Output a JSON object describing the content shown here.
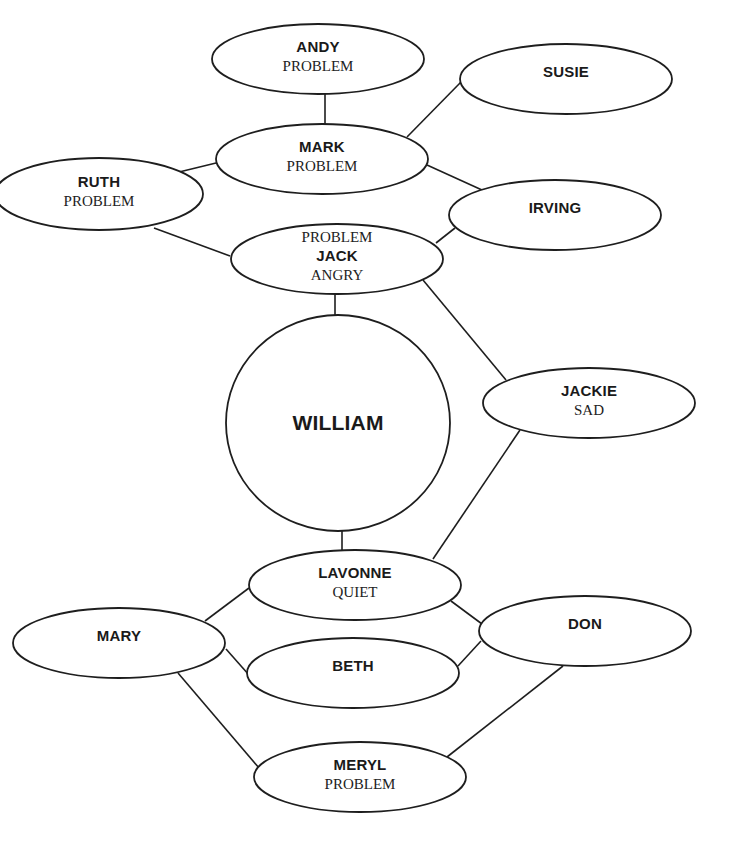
{
  "diagram": {
    "type": "relationship-map",
    "colors": {
      "stroke": "#1e1e1e",
      "fill": "#ffffff",
      "text": "#1a1a1a"
    },
    "nodes": [
      {
        "id": "andy",
        "name": "ANDY",
        "labels_above": [],
        "labels_below": [
          "PROBLEM"
        ],
        "shape": "ellipse",
        "cx": 318,
        "cy": 59,
        "rx": 106,
        "ry": 35
      },
      {
        "id": "susie",
        "name": "SUSIE",
        "labels_above": [],
        "labels_below": [],
        "shape": "ellipse",
        "cx": 566,
        "cy": 79,
        "rx": 106,
        "ry": 35
      },
      {
        "id": "mark",
        "name": "MARK",
        "labels_above": [],
        "labels_below": [
          "PROBLEM"
        ],
        "shape": "ellipse",
        "cx": 322,
        "cy": 159,
        "rx": 106,
        "ry": 35
      },
      {
        "id": "ruth",
        "name": "RUTH",
        "labels_above": [],
        "labels_below": [
          "PROBLEM"
        ],
        "shape": "ellipse",
        "cx": 99,
        "cy": 194,
        "rx": 104,
        "ry": 36
      },
      {
        "id": "irving",
        "name": "IRVING",
        "labels_above": [],
        "labels_below": [],
        "shape": "ellipse",
        "cx": 555,
        "cy": 215,
        "rx": 106,
        "ry": 35
      },
      {
        "id": "jack",
        "name": "JACK",
        "labels_above": [
          "PROBLEM"
        ],
        "labels_below": [
          "ANGRY"
        ],
        "shape": "ellipse",
        "cx": 337,
        "cy": 259,
        "rx": 106,
        "ry": 35
      },
      {
        "id": "william",
        "name": "WILLIAM",
        "labels_above": [],
        "labels_below": [],
        "shape": "circle",
        "cx": 338,
        "cy": 423,
        "rx": 112,
        "ry": 108
      },
      {
        "id": "jackie",
        "name": "JACKIE",
        "labels_above": [],
        "labels_below": [
          "SAD"
        ],
        "shape": "ellipse",
        "cx": 589,
        "cy": 403,
        "rx": 106,
        "ry": 35
      },
      {
        "id": "lavonne",
        "name": "LAVONNE",
        "labels_above": [],
        "labels_below": [
          "QUIET"
        ],
        "shape": "ellipse",
        "cx": 355,
        "cy": 585,
        "rx": 106,
        "ry": 35
      },
      {
        "id": "mary",
        "name": "MARY",
        "labels_above": [],
        "labels_below": [],
        "shape": "ellipse",
        "cx": 119,
        "cy": 643,
        "rx": 106,
        "ry": 35
      },
      {
        "id": "don",
        "name": "DON",
        "labels_above": [],
        "labels_below": [],
        "shape": "ellipse",
        "cx": 585,
        "cy": 631,
        "rx": 106,
        "ry": 35
      },
      {
        "id": "beth",
        "name": "BETH",
        "labels_above": [],
        "labels_below": [],
        "shape": "ellipse",
        "cx": 353,
        "cy": 673,
        "rx": 106,
        "ry": 35
      },
      {
        "id": "meryl",
        "name": "MERYL",
        "labels_above": [],
        "labels_below": [
          "PROBLEM"
        ],
        "shape": "ellipse",
        "cx": 360,
        "cy": 777,
        "rx": 106,
        "ry": 35
      }
    ],
    "edges": [
      {
        "from": "andy",
        "to": "mark",
        "x1": 325,
        "y1": 94,
        "x2": 325,
        "y2": 124
      },
      {
        "from": "mark",
        "to": "susie",
        "x1": 407,
        "y1": 137,
        "x2": 461,
        "y2": 82
      },
      {
        "from": "mark",
        "to": "ruth",
        "x1": 216,
        "y1": 163,
        "x2": 175,
        "y2": 173
      },
      {
        "from": "mark",
        "to": "irving",
        "x1": 427,
        "y1": 165,
        "x2": 482,
        "y2": 190
      },
      {
        "from": "ruth",
        "to": "jack",
        "x1": 154,
        "y1": 228,
        "x2": 230,
        "y2": 256
      },
      {
        "from": "jack",
        "to": "irving",
        "x1": 436,
        "y1": 243,
        "x2": 455,
        "y2": 228
      },
      {
        "from": "jack",
        "to": "william",
        "x1": 335,
        "y1": 294,
        "x2": 335,
        "y2": 316
      },
      {
        "from": "jack",
        "to": "jackie",
        "x1": 423,
        "y1": 280,
        "x2": 506,
        "y2": 380
      },
      {
        "from": "jackie",
        "to": "lavonne",
        "x1": 520,
        "y1": 430,
        "x2": 433,
        "y2": 559
      },
      {
        "from": "william",
        "to": "lavonne",
        "x1": 342,
        "y1": 531,
        "x2": 342,
        "y2": 550
      },
      {
        "from": "lavonne",
        "to": "mary",
        "x1": 249,
        "y1": 588,
        "x2": 205,
        "y2": 621
      },
      {
        "from": "mary",
        "to": "beth",
        "x1": 226,
        "y1": 649,
        "x2": 249,
        "y2": 675
      },
      {
        "from": "lavonne",
        "to": "don",
        "x1": 451,
        "y1": 601,
        "x2": 482,
        "y2": 624
      },
      {
        "from": "beth",
        "to": "don",
        "x1": 458,
        "y1": 666,
        "x2": 481,
        "y2": 641
      },
      {
        "from": "mary",
        "to": "meryl",
        "x1": 178,
        "y1": 673,
        "x2": 259,
        "y2": 768
      },
      {
        "from": "don",
        "to": "meryl",
        "x1": 563,
        "y1": 666,
        "x2": 447,
        "y2": 757
      }
    ]
  }
}
